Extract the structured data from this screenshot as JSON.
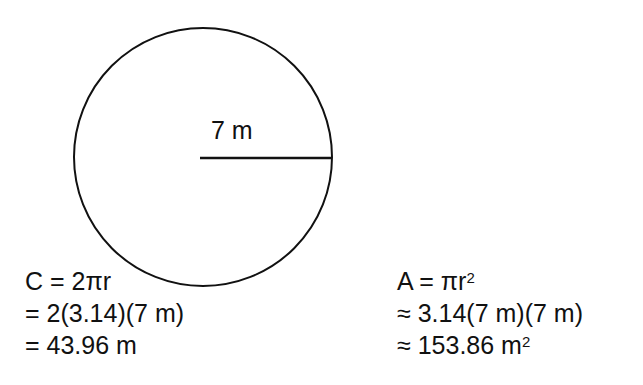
{
  "figure": {
    "shape": "circle",
    "radius_label": "7 m",
    "circle": {
      "cx": 203,
      "cy": 157,
      "r": 129,
      "stroke": "#111111"
    },
    "radius_line": {
      "x1": 200,
      "y1": 158,
      "x2": 331,
      "y2": 158
    }
  },
  "circumference": {
    "lines": [
      {
        "prefix": "C = 2",
        "symbol": "π",
        "suffix": "r",
        "sup": ""
      },
      {
        "prefix": "= 2(3.14)(7 m)",
        "symbol": "",
        "suffix": "",
        "sup": ""
      },
      {
        "prefix": "= 43.96 m",
        "symbol": "",
        "suffix": "",
        "sup": ""
      }
    ]
  },
  "area": {
    "lines": [
      {
        "prefix": "A = ",
        "symbol": "π",
        "suffix": "r",
        "sup": "2"
      },
      {
        "prefix": "≈ 3.14(7 m)(7 m)",
        "symbol": "",
        "suffix": "",
        "sup": ""
      },
      {
        "prefix": "≈ 153.86 m",
        "symbol": "",
        "suffix": "",
        "sup": "2"
      }
    ]
  }
}
